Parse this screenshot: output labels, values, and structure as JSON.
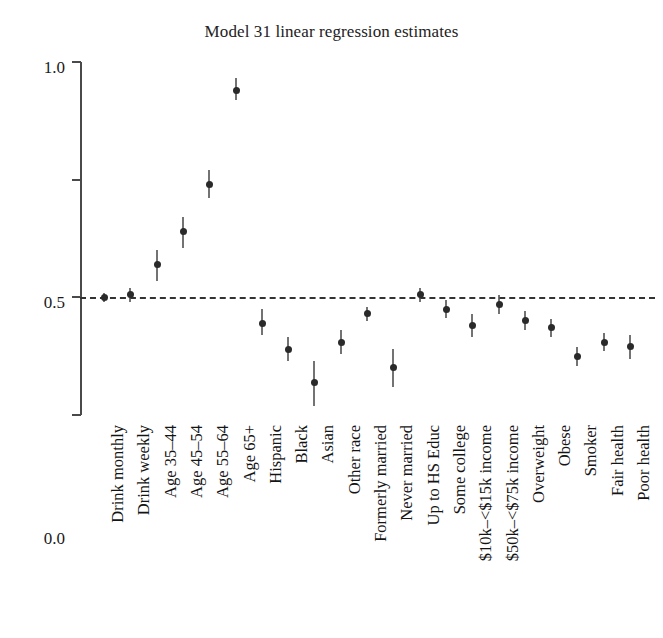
{
  "chart_data": {
    "type": "scatter",
    "title": "Model 31 linear regression estimates",
    "xlabel": "",
    "ylabel": "",
    "ylim": [
      -0.5,
      1.0
    ],
    "yticks": [
      "1.0",
      "0.5",
      "0.0",
      "-0.5"
    ],
    "ytick_values": [
      1.0,
      0.5,
      0.0,
      -0.5
    ],
    "grid": false,
    "legend": "none",
    "reference_line": 0.0,
    "reference_line_style": "dashed",
    "marker_style": "point estimate with vertical confidence interval",
    "categories": [
      "Drink monthly",
      "Drink weekly",
      "Age 35–44",
      "Age 45–54",
      "Age 55–64",
      "Age 65+",
      "Hispanic",
      "Black",
      "Asian",
      "Other race",
      "Formerly married",
      "Never married",
      "Up to HS Educ",
      "Some college",
      "$10k–<$15k income",
      "$50k–<$75k income",
      "Overweight",
      "Obese",
      "Smoker",
      "Fair health",
      "Poor health"
    ],
    "values": [
      0.0,
      0.01,
      0.14,
      0.28,
      0.48,
      0.88,
      -0.11,
      -0.22,
      -0.36,
      -0.19,
      -0.07,
      -0.3,
      0.01,
      -0.05,
      -0.12,
      -0.03,
      -0.1,
      -0.13,
      -0.25,
      -0.19,
      -0.21
    ],
    "ci_low": [
      -0.02,
      -0.02,
      0.07,
      0.21,
      0.42,
      0.84,
      -0.16,
      -0.27,
      -0.46,
      -0.24,
      -0.1,
      -0.38,
      -0.02,
      -0.09,
      -0.17,
      -0.07,
      -0.14,
      -0.17,
      -0.29,
      -0.23,
      -0.26
    ],
    "ci_high": [
      0.02,
      0.04,
      0.2,
      0.34,
      0.54,
      0.93,
      -0.05,
      -0.17,
      -0.27,
      -0.14,
      -0.04,
      -0.22,
      0.04,
      -0.01,
      -0.07,
      0.01,
      -0.06,
      -0.09,
      -0.21,
      -0.15,
      -0.16
    ]
  },
  "colors": {
    "marker": "#2a2a2a",
    "whisker": "#4b4b4b",
    "axis": "#4a4a4a",
    "reference_line": "#333333",
    "background": "#ffffff",
    "text": "#1a1a1a"
  }
}
